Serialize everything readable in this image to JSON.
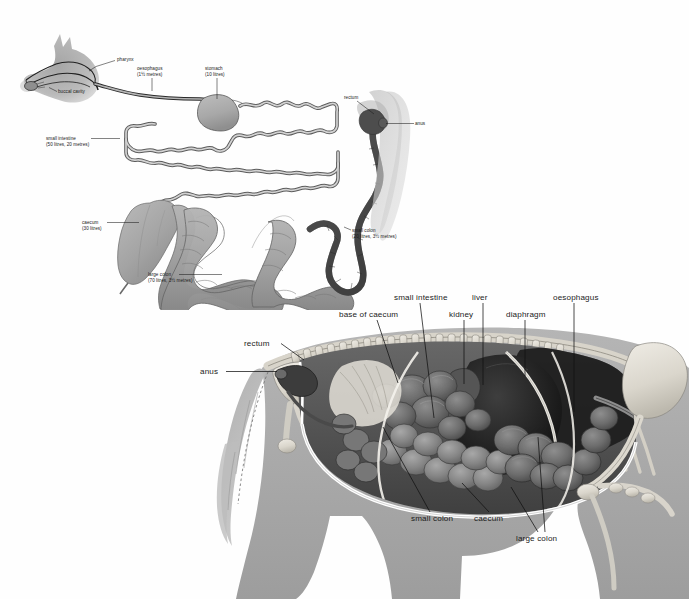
{
  "document": {
    "title": "Equine digestive system",
    "background_color": "#fefefe",
    "figures": [
      {
        "id": "top",
        "caption": "Schematic of the horse digestive tract with capacities and lengths"
      },
      {
        "id": "bottom",
        "caption": "Cutaway anatomical illustration of the horse abdomen"
      }
    ]
  },
  "colors": {
    "ink": "#1b1b1b",
    "silhouette_grey": "#a9a9a9",
    "silhouette_light": "#c4c4c4",
    "organ_light": "#cfcfcf",
    "organ_mid": "#a6a6a6",
    "organ_dark": "#6d6d6d",
    "organ_darkest": "#4a4a4a",
    "tract_outline": "#2a2a2a",
    "bone_light": "#e6e3dc",
    "bone_mid": "#c9c5bb",
    "tissue_dark": "#3a3a3a",
    "tissue_black": "#1f1f1f"
  },
  "top_figure": {
    "name": "digestive-tract-schematic",
    "labels": [
      {
        "key": "pharynx",
        "line1": "pharynx",
        "line2": "",
        "x": 117,
        "y": 61,
        "anchor": "start",
        "leader": "M 115 60.5 L 96 66.5 L 89 71"
      },
      {
        "key": "buccal-cavity",
        "line1": "buccal cavity",
        "line2": "",
        "x": 58,
        "y": 93,
        "anchor": "start",
        "leader": "M 57 91.5 L 49 87.5"
      },
      {
        "key": "oesophagus",
        "line1": "oesophagus",
        "line2": "(1½ metres)",
        "x": 137,
        "y": 70,
        "anchor": "start",
        "leader": "M 152 78 L 152 91"
      },
      {
        "key": "stomach",
        "line1": "stomach",
        "line2": "(10 litres)",
        "x": 205,
        "y": 70,
        "anchor": "start",
        "leader": "M 217 78 L 217 99"
      },
      {
        "key": "small-intestine",
        "line1": "small intestine",
        "line2": "(50 litres, 20 metres)",
        "x": 46,
        "y": 140,
        "anchor": "start",
        "leader": "M 91 138.5 L 120 138.5"
      },
      {
        "key": "caecum",
        "line1": "caecum",
        "line2": "(30 litres)",
        "x": 82,
        "y": 224,
        "anchor": "start",
        "leader": "M 107 222.5 L 139 222.5"
      },
      {
        "key": "large-colon",
        "line1": "large colon",
        "line2": "(70 litres, 3½ metres)",
        "x": 148,
        "y": 276,
        "anchor": "start",
        "leader": "M 179 274.5 L 222 274.5"
      },
      {
        "key": "small-colon",
        "line1": "small colon",
        "line2": "(20 litres, 3½ metres)",
        "x": 352,
        "y": 232,
        "anchor": "start",
        "leader": "M 351 230 L 344 227"
      },
      {
        "key": "rectum",
        "line1": "rectum",
        "line2": "",
        "x": 344,
        "y": 99,
        "anchor": "start",
        "leader": "M 357 101 L 374 114"
      },
      {
        "key": "anus",
        "line1": "anus",
        "line2": "",
        "x": 415,
        "y": 125,
        "anchor": "start",
        "leader": "M 414 123.5 L 386 123.5"
      }
    ]
  },
  "bottom_figure": {
    "name": "horse-abdomen-cutaway",
    "labels": [
      {
        "key": "anus",
        "text": "anus",
        "x": 200,
        "y": 374,
        "anchor": "start",
        "leader": "M 226 371.5 L 277 371.5"
      },
      {
        "key": "rectum",
        "text": "rectum",
        "x": 244,
        "y": 346,
        "anchor": "start",
        "leader": "M 281 343.5 L 304 360"
      },
      {
        "key": "base-of-caecum",
        "text": "base of caecum",
        "x": 339,
        "y": 317,
        "anchor": "start",
        "leader": "M 377 320 L 398 383"
      },
      {
        "key": "small-intestine",
        "text": "small intestine",
        "x": 394,
        "y": 300,
        "anchor": "start",
        "leader": "M 420 303 L 434 418"
      },
      {
        "key": "kidney",
        "text": "kidney",
        "x": 449,
        "y": 317,
        "anchor": "start",
        "leader": "M 464 320 L 464 384"
      },
      {
        "key": "liver",
        "text": "liver",
        "x": 472,
        "y": 300,
        "anchor": "start",
        "leader": "M 483 303 L 483 385"
      },
      {
        "key": "diaphragm",
        "text": "diaphragm",
        "x": 506,
        "y": 317,
        "anchor": "start",
        "leader": "M 525 320 L 525 376"
      },
      {
        "key": "oesophagus",
        "text": "oesophagus",
        "x": 553,
        "y": 300,
        "anchor": "start",
        "leader": "M 574 303 L 574 412"
      },
      {
        "key": "small-colon",
        "text": "small colon",
        "x": 411,
        "y": 521,
        "anchor": "start",
        "leader": "M 430 512 L 383 427"
      },
      {
        "key": "caecum",
        "text": "caecum",
        "x": 474,
        "y": 521,
        "anchor": "start",
        "leader": "M 489 512 L 462 483"
      },
      {
        "key": "large-colon",
        "text": "large colon",
        "x": 516,
        "y": 541,
        "anchor": "start",
        "leader": "M 538 532 L 511 487 M 545 532 L 538 437"
      }
    ]
  }
}
